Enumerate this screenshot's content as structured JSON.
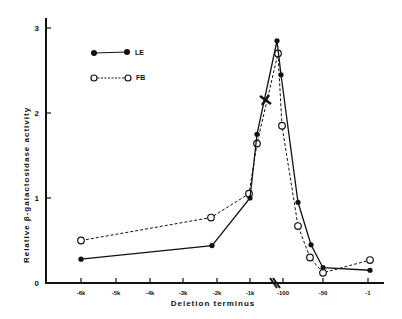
{
  "chart_data": {
    "type": "line",
    "title": "",
    "xlabel": "Deletion terminus",
    "ylabel": "Relative β-galactosidase activity",
    "ylim": [
      0,
      3
    ],
    "yticks": [
      "0",
      "1",
      "2",
      "3"
    ],
    "xticks": [
      "-6k",
      "-5k",
      "-4k",
      "-3k",
      "-2k",
      "-1k",
      "-100",
      "-50",
      "-1"
    ],
    "x_axis_break": "between -1k and -100",
    "grid": false,
    "legend_position": "upper-left",
    "series": [
      {
        "name": "LE",
        "marker": "filled-circle",
        "line": "solid",
        "points": [
          {
            "x": "-6k",
            "y": 0.28
          },
          {
            "x": "-2k",
            "y": 0.44
          },
          {
            "x": "-1k",
            "y": 1.0
          },
          {
            "x": "~-500",
            "y": 1.75
          },
          {
            "x": "~-150",
            "y": 2.85
          },
          {
            "x": "~-130",
            "y": 2.45
          },
          {
            "x": "~-80",
            "y": 0.95
          },
          {
            "x": "~-65",
            "y": 0.45
          },
          {
            "x": "-50",
            "y": 0.18
          },
          {
            "x": "-1",
            "y": 0.15
          }
        ]
      },
      {
        "name": "FB",
        "marker": "open-circle",
        "line": "dashed",
        "points": [
          {
            "x": "-6k",
            "y": 0.5
          },
          {
            "x": "-2k",
            "y": 0.77
          },
          {
            "x": "-1k",
            "y": 1.05
          },
          {
            "x": "~-500",
            "y": 1.64
          },
          {
            "x": "~-150",
            "y": 2.7
          },
          {
            "x": "~-130",
            "y": 1.85
          },
          {
            "x": "~-80",
            "y": 0.67
          },
          {
            "x": "~-65",
            "y": 0.3
          },
          {
            "x": "-50",
            "y": 0.12
          },
          {
            "x": "-1",
            "y": 0.27
          }
        ]
      }
    ],
    "annotations": [
      "cross marker on rising segment near y≈2.15",
      "axis break marks near -100"
    ]
  },
  "legend": {
    "items": [
      {
        "label": "LE"
      },
      {
        "label": "FB"
      }
    ]
  }
}
